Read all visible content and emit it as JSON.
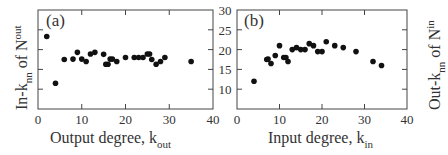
{
  "chart_data": [
    {
      "type": "scatter",
      "panel_label": "(a)",
      "xlabel": "Output degree, k_out",
      "xlabel_main": "Output degree, k",
      "xlabel_sub": "out",
      "ylabel": "In-k_nn of N^out",
      "xlim": [
        0,
        40
      ],
      "ylim": [
        5,
        30
      ],
      "xticks": [
        "0",
        "10",
        "20",
        "30",
        "40"
      ],
      "yticks": [
        "10",
        "15",
        "20",
        "25",
        "30"
      ],
      "x": [
        2,
        4,
        6,
        8,
        9,
        10,
        11,
        12,
        13,
        15,
        15.5,
        16,
        16.5,
        17,
        18,
        20,
        22,
        23,
        24,
        25,
        25.5,
        26,
        27,
        28,
        29,
        35
      ],
      "y": [
        23.3,
        11.5,
        17.5,
        17.6,
        19.3,
        17.6,
        17.0,
        18.9,
        19.3,
        18.8,
        16.3,
        16.3,
        17.6,
        17.6,
        17.0,
        18.0,
        18.0,
        18.0,
        18.0,
        18.9,
        18.9,
        17.5,
        16.3,
        17.0,
        18.0,
        17.0
      ]
    },
    {
      "type": "scatter",
      "panel_label": "(b)",
      "xlabel": "Input degree, k_in",
      "xlabel_main": "Input degree, k",
      "xlabel_sub": "in",
      "ylabel": "Out-k_nn of N^in",
      "xlim": [
        0,
        40
      ],
      "ylim": [
        5,
        30
      ],
      "xticks": [
        "0",
        "10",
        "20",
        "30",
        "40"
      ],
      "yticks": [
        "10",
        "15",
        "20",
        "25",
        "30"
      ],
      "x": [
        4,
        7,
        7.3,
        8,
        9,
        10,
        11,
        11.5,
        12,
        13,
        14,
        15,
        16,
        17,
        18,
        19,
        20,
        21,
        23,
        25,
        28,
        32,
        34
      ],
      "y": [
        12.0,
        17.5,
        17.6,
        16.5,
        18.5,
        21.0,
        18.0,
        18.0,
        17.0,
        20.0,
        20.5,
        20.0,
        20.0,
        21.5,
        21.0,
        19.5,
        19.5,
        22.0,
        21.0,
        20.5,
        19.5,
        17.0,
        16.0
      ]
    }
  ],
  "shared_axis": {
    "yticks": [
      "10",
      "15",
      "20",
      "25",
      "30"
    ]
  }
}
